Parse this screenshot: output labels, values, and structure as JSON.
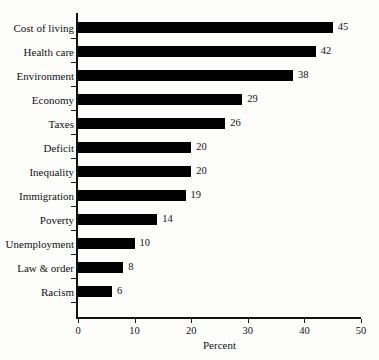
{
  "chart_data": {
    "type": "bar",
    "orientation": "horizontal",
    "title": "",
    "xlabel": "Percent",
    "ylabel": "",
    "xlim": [
      0,
      50
    ],
    "xticks": [
      0,
      10,
      20,
      30,
      40,
      50
    ],
    "grid": false,
    "legend": null,
    "bar_color": "#000000",
    "background_color": "#fdfdfc",
    "categories": [
      "Cost of living",
      "Health care",
      "Environment",
      "Economy",
      "Taxes",
      "Deficit",
      "Inequality",
      "Immigration",
      "Poverty",
      "Unemployment",
      "Law & order",
      "Racism"
    ],
    "values": [
      45,
      42,
      38,
      29,
      26,
      20,
      20,
      19,
      14,
      10,
      8,
      6
    ],
    "value_labels": [
      "45",
      "42",
      "38",
      "29",
      "26",
      "20",
      "20",
      "19",
      "14",
      "10",
      "8",
      "6"
    ],
    "xtick_labels": [
      "0",
      "10",
      "20",
      "30",
      "40",
      "50"
    ]
  }
}
